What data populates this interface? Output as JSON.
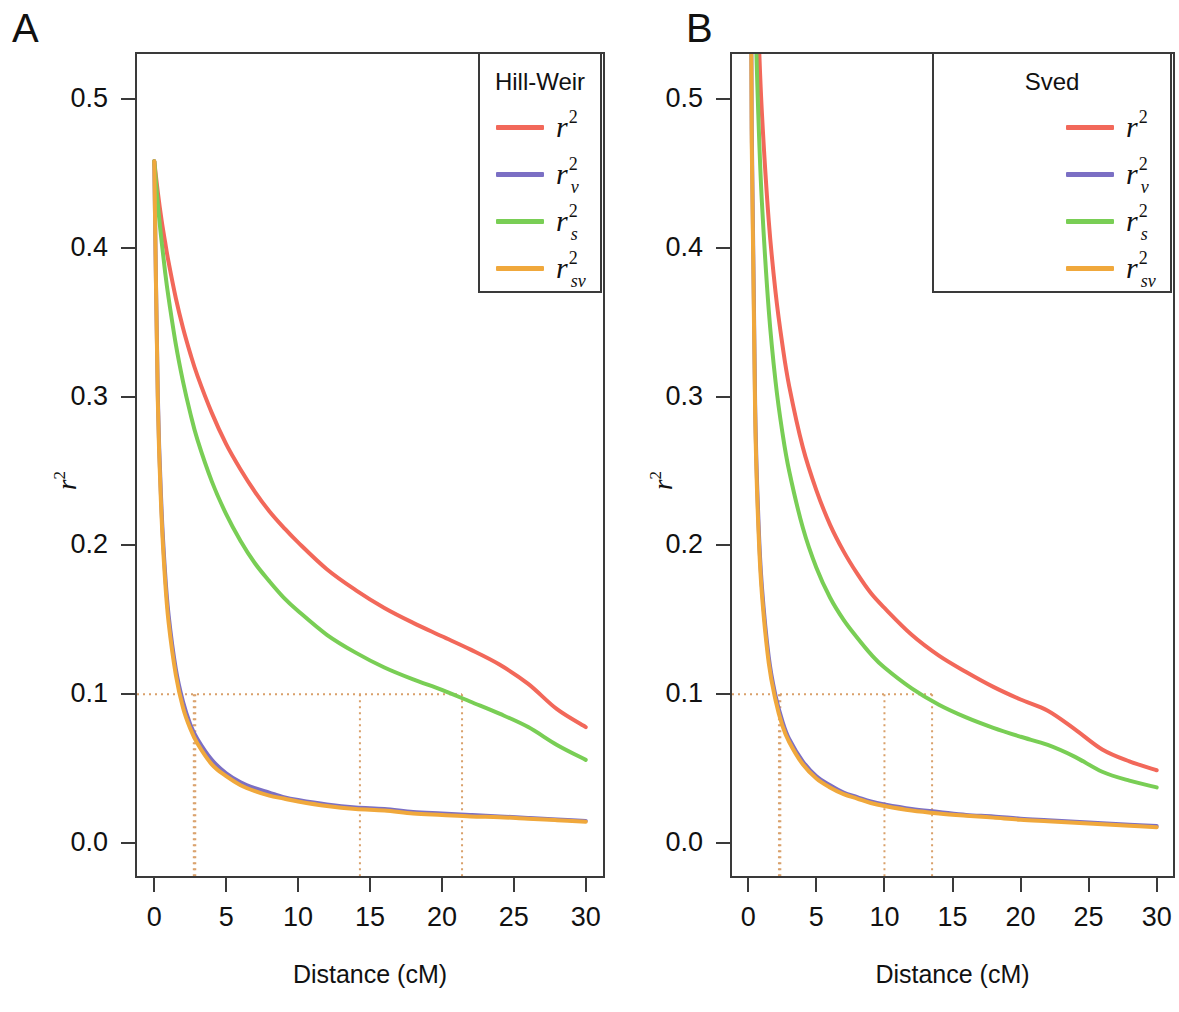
{
  "figure": {
    "panels": [
      {
        "letter": "A",
        "model": "Hill-Weir",
        "legend_title": "Hill-Weir",
        "x_title": "Distance (cM)",
        "y_title": "r2"
      },
      {
        "letter": "B",
        "model": "Sved",
        "legend_title": "Sved",
        "x_title": "Distance (cM)",
        "y_title": "r2"
      }
    ],
    "series_names": [
      "r2",
      "r2_v",
      "r2_s",
      "r2_sv"
    ],
    "colors": {
      "r2": "#F2685A",
      "r2_v": "#7B6FC4",
      "r2_s": "#79CE55",
      "r2_sv": "#F0A83C",
      "axis": "#3a3a3a",
      "reference_line": "#D9A06A"
    }
  },
  "chart_data": [
    {
      "type": "line",
      "title": "A",
      "legend_title": "Hill-Weir",
      "xlabel": "Distance (cM)",
      "ylabel": "r2",
      "xlim": [
        -1.2,
        31.2
      ],
      "ylim": [
        -0.022,
        0.53
      ],
      "xticks": [
        0,
        5,
        10,
        15,
        20,
        25,
        30
      ],
      "xticklabels": [
        "0",
        "5",
        "10",
        "15",
        "20",
        "25",
        "30"
      ],
      "yticks": [
        0.0,
        0.1,
        0.2,
        0.3,
        0.4,
        0.5
      ],
      "yticklabels": [
        "0.0",
        "0.1",
        "0.2",
        "0.3",
        "0.4",
        "0.5"
      ],
      "grid": false,
      "legend_position": "top-right",
      "reference_y": 0.1,
      "reference_x_crossings": [
        21.4,
        14.3,
        2.85,
        2.75
      ],
      "x": [
        0,
        0.25,
        0.5,
        0.75,
        1,
        1.5,
        2,
        2.5,
        3,
        4,
        5,
        6,
        7,
        8,
        9,
        10,
        12,
        14,
        16,
        18,
        20,
        22,
        24,
        26,
        28,
        30
      ],
      "series": [
        {
          "name": "r2",
          "label": "r2",
          "color": "#F2685A",
          "values": [
            0.458,
            0.437,
            0.419,
            0.404,
            0.39,
            0.366,
            0.346,
            0.329,
            0.314,
            0.289,
            0.268,
            0.251,
            0.236,
            0.223,
            0.212,
            0.202,
            0.184,
            0.17,
            0.158,
            0.148,
            0.139,
            0.13,
            0.12,
            0.107,
            0.09,
            0.078
          ]
        },
        {
          "name": "r2_v",
          "label": "r2_v",
          "color": "#7B6FC4",
          "values": [
            0.458,
            0.3,
            0.226,
            0.182,
            0.153,
            0.117,
            0.095,
            0.08,
            0.07,
            0.056,
            0.047,
            0.041,
            0.037,
            0.034,
            0.031,
            0.029,
            0.026,
            0.024,
            0.023,
            0.021,
            0.02,
            0.019,
            0.018,
            0.017,
            0.016,
            0.015
          ]
        },
        {
          "name": "r2_s",
          "label": "r2_s",
          "color": "#79CE55",
          "values": [
            0.458,
            0.429,
            0.405,
            0.384,
            0.366,
            0.335,
            0.31,
            0.289,
            0.271,
            0.243,
            0.221,
            0.203,
            0.188,
            0.176,
            0.165,
            0.156,
            0.14,
            0.128,
            0.118,
            0.11,
            0.103,
            0.095,
            0.087,
            0.078,
            0.066,
            0.056
          ]
        },
        {
          "name": "r2_sv",
          "label": "r2_sv",
          "color": "#F0A83C",
          "values": [
            0.458,
            0.296,
            0.221,
            0.177,
            0.148,
            0.113,
            0.091,
            0.077,
            0.067,
            0.053,
            0.045,
            0.039,
            0.035,
            0.032,
            0.03,
            0.028,
            0.025,
            0.023,
            0.022,
            0.02,
            0.019,
            0.018,
            0.0175,
            0.0165,
            0.0155,
            0.0145
          ]
        }
      ]
    },
    {
      "type": "line",
      "title": "B",
      "legend_title": "Sved",
      "xlabel": "Distance (cM)",
      "ylabel": "r2",
      "xlim": [
        -1.2,
        31.2
      ],
      "ylim": [
        -0.022,
        0.53
      ],
      "xticks": [
        0,
        5,
        10,
        15,
        20,
        25,
        30
      ],
      "xticklabels": [
        "0",
        "5",
        "10",
        "15",
        "20",
        "25",
        "30"
      ],
      "yticks": [
        0.0,
        0.1,
        0.2,
        0.3,
        0.4,
        0.5
      ],
      "yticklabels": [
        "0.0",
        "0.1",
        "0.2",
        "0.3",
        "0.4",
        "0.5"
      ],
      "grid": false,
      "legend_position": "top-right",
      "reference_y": 0.1,
      "reference_x_crossings": [
        13.5,
        10.0,
        2.35,
        2.25
      ],
      "x": [
        0.05,
        0.1,
        0.25,
        0.5,
        0.75,
        1,
        1.5,
        2,
        2.5,
        3,
        4,
        5,
        6,
        7,
        8,
        9,
        10,
        12,
        14,
        16,
        18,
        20,
        22,
        24,
        26,
        28,
        30
      ],
      "series": [
        {
          "name": "r2",
          "label": "r2",
          "color": "#F2685A",
          "values": [
            0.95,
            0.9,
            0.75,
            0.62,
            0.545,
            0.49,
            0.418,
            0.37,
            0.335,
            0.307,
            0.266,
            0.237,
            0.214,
            0.196,
            0.181,
            0.168,
            0.158,
            0.14,
            0.126,
            0.115,
            0.105,
            0.0965,
            0.089,
            0.0765,
            0.063,
            0.055,
            0.049
          ]
        },
        {
          "name": "r2_v",
          "label": "r2_v",
          "color": "#7B6FC4",
          "values": [
            0.95,
            0.82,
            0.48,
            0.295,
            0.215,
            0.172,
            0.125,
            0.099,
            0.082,
            0.07,
            0.055,
            0.045,
            0.039,
            0.034,
            0.031,
            0.028,
            0.026,
            0.023,
            0.021,
            0.019,
            0.018,
            0.0165,
            0.0155,
            0.0145,
            0.0135,
            0.0125,
            0.0115
          ]
        },
        {
          "name": "r2_s",
          "label": "r2_s",
          "color": "#79CE55",
          "values": [
            0.94,
            0.87,
            0.7,
            0.565,
            0.485,
            0.43,
            0.358,
            0.31,
            0.276,
            0.25,
            0.212,
            0.185,
            0.165,
            0.15,
            0.138,
            0.127,
            0.118,
            0.104,
            0.093,
            0.0845,
            0.0775,
            0.0715,
            0.066,
            0.058,
            0.048,
            0.042,
            0.0375
          ]
        },
        {
          "name": "r2_sv",
          "label": "r2_sv",
          "color": "#F0A83C",
          "values": [
            0.95,
            0.81,
            0.47,
            0.288,
            0.209,
            0.167,
            0.121,
            0.096,
            0.079,
            0.068,
            0.053,
            0.0435,
            0.0375,
            0.033,
            0.03,
            0.027,
            0.025,
            0.022,
            0.02,
            0.0185,
            0.0172,
            0.0158,
            0.0148,
            0.0138,
            0.0128,
            0.0118,
            0.0108
          ]
        }
      ]
    }
  ]
}
